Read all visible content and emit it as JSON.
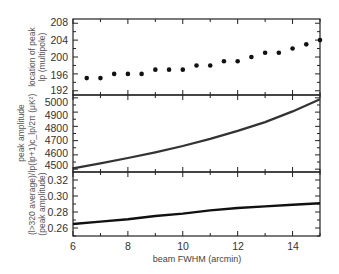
{
  "figure": {
    "xlabel": "beam FWHM (arcmin)",
    "x_ticks": [
      "6",
      "8",
      "10",
      "12",
      "14"
    ]
  },
  "panels": [
    {
      "ylabel_line1": "location of peak",
      "ylabel_line2": "lp (multipole)",
      "y_ticks": [
        "192",
        "196",
        "200",
        "204",
        "208"
      ]
    },
    {
      "ylabel_line1": "peak amplitude",
      "ylabel_line2": "lp(lp+1)c_lp/2π (μK²)",
      "y_ticks": [
        "4500",
        "4600",
        "4700",
        "4800",
        "4900",
        "5000"
      ]
    },
    {
      "ylabel_line1": "(l>320 average)/",
      "ylabel_line2": "(peak amplitude)",
      "y_ticks": [
        "0.26",
        "0.28",
        "0.30",
        "0.32"
      ]
    }
  ],
  "chart_data": [
    {
      "type": "scatter",
      "title": "",
      "xlabel": "beam FWHM (arcmin)",
      "ylabel": "location of peak lp (multipole)",
      "xlim": [
        6,
        15
      ],
      "ylim": [
        191,
        209
      ],
      "grid": false,
      "x": [
        6.5,
        7.0,
        7.5,
        8.0,
        8.5,
        9.0,
        9.5,
        10.0,
        10.5,
        11.0,
        11.5,
        12.0,
        12.5,
        13.0,
        13.5,
        14.0,
        14.5,
        15.0
      ],
      "y": [
        195,
        195,
        196,
        196,
        196,
        197,
        197,
        197,
        198,
        198,
        199,
        199,
        200,
        201,
        201,
        202,
        203,
        204
      ],
      "y_ticks": [
        192,
        196,
        200,
        204,
        208
      ]
    },
    {
      "type": "line",
      "title": "",
      "xlabel": "beam FWHM (arcmin)",
      "ylabel": "peak amplitude lp(lp+1)c_lp/2π (μK²)",
      "xlim": [
        6,
        15
      ],
      "ylim": [
        4480,
        5020
      ],
      "grid": false,
      "x": [
        6,
        7,
        8,
        9,
        10,
        11,
        12,
        13,
        14,
        15
      ],
      "y": [
        4505,
        4540,
        4578,
        4618,
        4662,
        4712,
        4768,
        4830,
        4905,
        4990
      ],
      "y_ticks": [
        4500,
        4600,
        4700,
        4800,
        4900,
        5000
      ]
    },
    {
      "type": "line",
      "title": "",
      "xlabel": "beam FWHM (arcmin)",
      "ylabel": "(l>320 average)/(peak amplitude)",
      "xlim": [
        6,
        15
      ],
      "ylim": [
        0.25,
        0.33
      ],
      "grid": false,
      "x": [
        6,
        7,
        8,
        9,
        10,
        11,
        12,
        13,
        14,
        15
      ],
      "y": [
        0.265,
        0.268,
        0.271,
        0.275,
        0.278,
        0.282,
        0.285,
        0.287,
        0.289,
        0.291
      ],
      "y_ticks": [
        0.26,
        0.28,
        0.3,
        0.32
      ]
    }
  ]
}
